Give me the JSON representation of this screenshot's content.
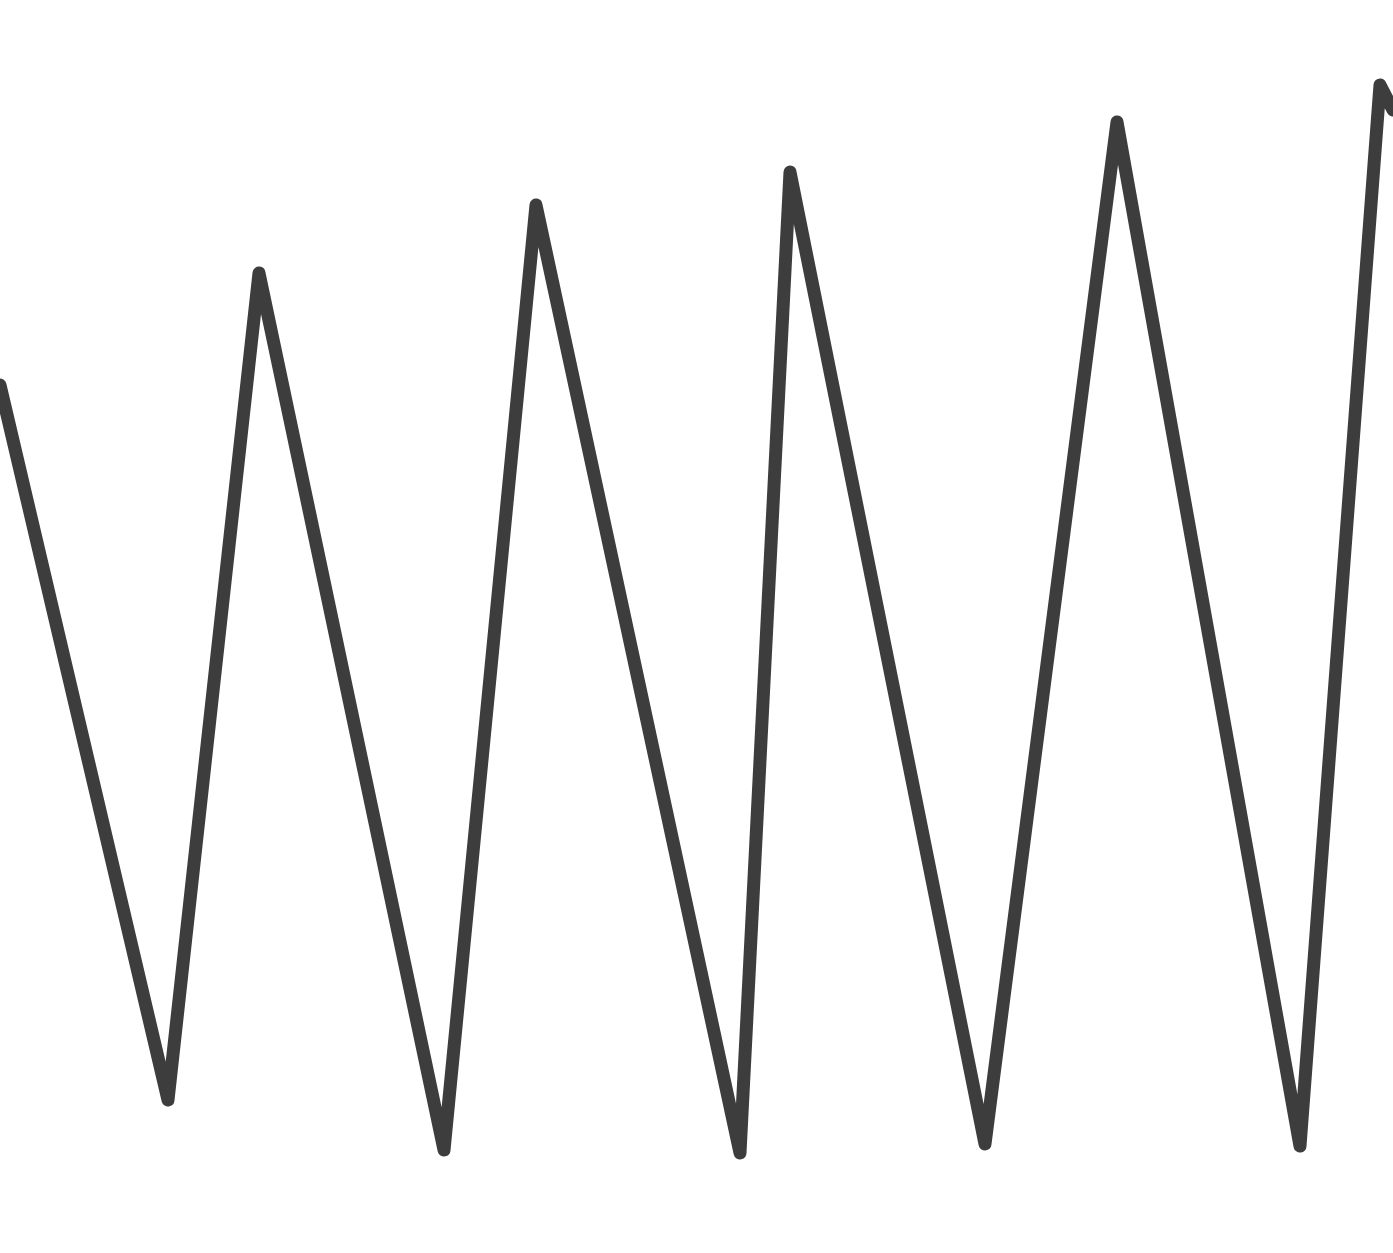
{
  "canvas": {
    "width": 1393,
    "height": 1253,
    "background": "#ffffff"
  },
  "zigzag": {
    "stroke": "#3d3d3d",
    "stroke_width": 13,
    "points": [
      [
        0,
        385
      ],
      [
        168,
        1100
      ],
      [
        259,
        273
      ],
      [
        444,
        1150
      ],
      [
        536,
        205
      ],
      [
        740,
        1153
      ],
      [
        790,
        172
      ],
      [
        985,
        1144
      ],
      [
        1117,
        122
      ],
      [
        1300,
        1146
      ],
      [
        1380,
        85
      ],
      [
        1393,
        110
      ]
    ]
  }
}
